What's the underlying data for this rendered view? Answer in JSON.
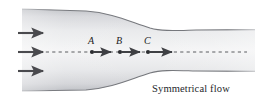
{
  "figure": {
    "kind": "fluid-flow-diagram",
    "caption": "Symmetrical flow",
    "canvas": {
      "width": 255,
      "height": 104,
      "background": "#ffffff"
    },
    "colors": {
      "arrow": "#4a4a4e",
      "wall": "#6d6f73",
      "fluid_light": "#f2f2f3",
      "fluid_mid": "#d9dade",
      "fluid_edge": "#b9bbc0",
      "label": "#1c1c1c",
      "caption": "#25272b",
      "centerline": "#5a5c60"
    },
    "points": [
      {
        "label": "A",
        "x": 92,
        "y": 52
      },
      {
        "label": "B",
        "x": 120,
        "y": 52
      },
      {
        "label": "C",
        "x": 148,
        "y": 52
      }
    ],
    "inlet_arrows": [
      {
        "y": 33
      },
      {
        "y": 52
      },
      {
        "y": 71
      }
    ],
    "centerline": {
      "y": 52,
      "x_start": 33,
      "x_end": 247,
      "style": "dashed"
    },
    "geometry": {
      "inlet_x": 22,
      "outlet_x": 255,
      "inlet_top_y": 9,
      "inlet_bottom_y": 89,
      "throat_top_y": 30,
      "throat_bottom_y": 70,
      "contraction_start_x": 95,
      "contraction_end_x": 172
    }
  }
}
